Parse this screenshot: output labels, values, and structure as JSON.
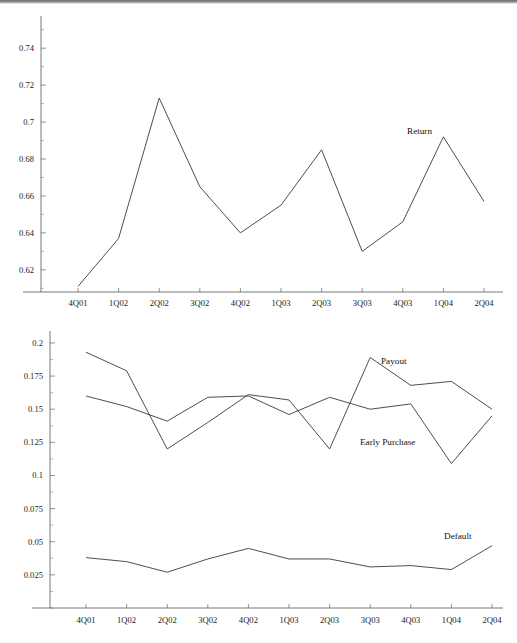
{
  "figure": {
    "panels": [
      {
        "name": "return-panel",
        "position": "top"
      },
      {
        "name": "payout-default-panel",
        "position": "bottom"
      }
    ]
  },
  "chart_data": [
    {
      "type": "line",
      "name": "return-chart",
      "title": "",
      "xlabel": "",
      "ylabel": "",
      "grid": false,
      "legend_position": "inline-annotation",
      "categories": [
        "4Q01",
        "1Q02",
        "2Q02",
        "3Q02",
        "4Q02",
        "1Q03",
        "2Q03",
        "3Q03",
        "4Q03",
        "1Q04",
        "2Q04"
      ],
      "ylim": [
        0.608,
        0.752
      ],
      "yticks": [
        0.62,
        0.64,
        0.66,
        0.68,
        0.7,
        0.72,
        0.74
      ],
      "ytick_labels": [
        "0.62",
        "0.64",
        "0.66",
        "0.68",
        "0.7",
        "0.72",
        "0.74"
      ],
      "series": [
        {
          "name": "Return",
          "label": "Return",
          "values": [
            0.611,
            0.637,
            0.713,
            0.665,
            0.64,
            0.655,
            0.685,
            0.63,
            0.646,
            0.692,
            0.657
          ]
        }
      ]
    },
    {
      "type": "line",
      "name": "payout-earlypurchase-default-chart",
      "title": "",
      "xlabel": "",
      "ylabel": "",
      "grid": false,
      "legend_position": "inline-annotation",
      "categories": [
        "4Q01",
        "1Q02",
        "2Q02",
        "3Q02",
        "4Q02",
        "1Q03",
        "2Q03",
        "3Q03",
        "4Q03",
        "1Q04",
        "2Q04"
      ],
      "ylim": [
        0.0,
        0.206
      ],
      "yticks": [
        0.025,
        0.05,
        0.075,
        0.1,
        0.125,
        0.15,
        0.175,
        0.2
      ],
      "ytick_labels": [
        "0.025",
        "0.05",
        "0.075",
        "0.1",
        "0.125",
        "0.15",
        "0.175",
        "0.2"
      ],
      "series": [
        {
          "name": "Payout",
          "label": "Payout",
          "values": [
            0.193,
            0.179,
            0.12,
            0.14,
            0.161,
            0.157,
            0.12,
            0.189,
            0.168,
            0.171,
            0.15
          ]
        },
        {
          "name": "Early Purchase",
          "label": "Early Purchase",
          "values": [
            0.16,
            0.152,
            0.141,
            0.159,
            0.16,
            0.146,
            0.159,
            0.15,
            0.154,
            0.109,
            0.145
          ]
        },
        {
          "name": "Default",
          "label": "Default",
          "values": [
            0.038,
            0.035,
            0.027,
            0.037,
            0.045,
            0.037,
            0.037,
            0.031,
            0.032,
            0.029,
            0.047
          ]
        }
      ]
    }
  ],
  "annotations": {
    "top_panel": [
      {
        "name": "return-label",
        "text": "Return",
        "x_px": 410,
        "y_px": 127
      }
    ],
    "bottom_panel": [
      {
        "name": "payout-label",
        "text": "Payout",
        "x_px": 382,
        "y_px": 362
      },
      {
        "name": "early-purchase-label",
        "text": "Early Purchase",
        "x_px": 363,
        "y_px": 443
      },
      {
        "name": "default-label",
        "text": "Default",
        "x_px": 447,
        "y_px": 538
      }
    ]
  }
}
